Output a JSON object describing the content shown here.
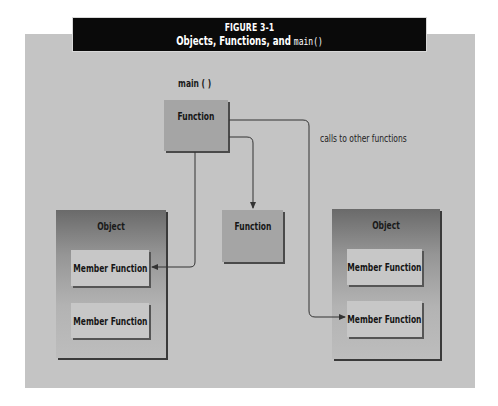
{
  "figure": {
    "number": "FIGURE 3-1",
    "title_prefix": "Objects, Functions, and ",
    "title_code": "main()"
  },
  "diagram": {
    "main_label": "main ( )",
    "main_function": "Function",
    "calls_note": "calls to other functions",
    "standalone_function": "Function",
    "objects": [
      {
        "title": "Object",
        "members": [
          "Member Function",
          "Member Function"
        ]
      },
      {
        "title": "Object",
        "members": [
          "Member Function",
          "Member Function"
        ]
      }
    ]
  },
  "colors": {
    "panel": "#c4c4c4",
    "titlebar": "#0a0a0a",
    "function_box": "#a5a5a5",
    "member_box": "#c7c7c7",
    "connector": "#333333"
  }
}
